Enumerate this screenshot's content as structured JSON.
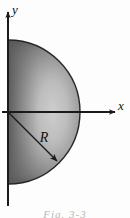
{
  "figure": {
    "background_color": "#fdfdfd",
    "axes": {
      "x_label": "x",
      "y_label": "y",
      "axis_color": "#1a1a1a",
      "origin": {
        "x": 8,
        "y": 112
      },
      "x_axis_end": {
        "x": 120,
        "y": 112
      },
      "y_axis_end": {
        "x": 8,
        "y": 8
      }
    },
    "shape": {
      "name": "semicircle",
      "orientation": "right-half",
      "center": {
        "x": 8,
        "y": 112
      },
      "radius": 72,
      "outline_color": "#262626",
      "fill_dark": "#5f5f5f",
      "fill_light": "#c9c9c9",
      "fill_edge": "#4a4a4a"
    },
    "radius_annotation": {
      "label": "R",
      "line_color": "#1c1c1c",
      "from": {
        "x": 8,
        "y": 112
      },
      "to": {
        "x": 59,
        "y": 163
      },
      "label_position": {
        "x": 44,
        "y": 142
      }
    },
    "caption": "Fig. 3-3"
  }
}
